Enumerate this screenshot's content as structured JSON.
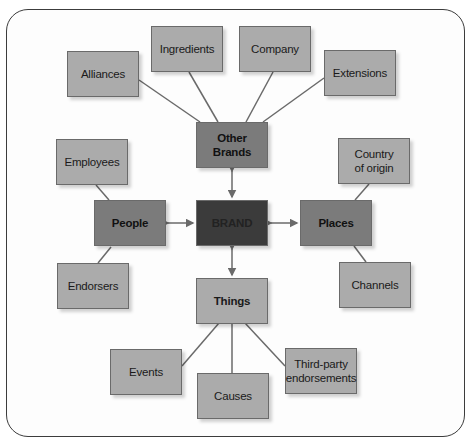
{
  "diagram": {
    "center": {
      "label": "BRAND"
    },
    "hubs": {
      "other_brands": {
        "label": "Other\nBrands"
      },
      "people": {
        "label": "People"
      },
      "places": {
        "label": "Places"
      },
      "things": {
        "label": "Things"
      }
    },
    "leaves": {
      "alliances": {
        "label": "Alliances"
      },
      "ingredients": {
        "label": "Ingredients"
      },
      "company": {
        "label": "Company"
      },
      "extensions": {
        "label": "Extensions"
      },
      "employees": {
        "label": "Employees"
      },
      "endorsers": {
        "label": "Endorsers"
      },
      "country_of_origin": {
        "label": "Country\nof origin"
      },
      "channels": {
        "label": "Channels"
      },
      "events": {
        "label": "Events"
      },
      "causes": {
        "label": "Causes"
      },
      "third_party": {
        "label": "Third-party\nendorsements"
      }
    },
    "colors": {
      "leaf": "#ababab",
      "hub": "#7b7b7b",
      "center": "#3b3b3b",
      "connector": "#6a6a6a"
    }
  }
}
